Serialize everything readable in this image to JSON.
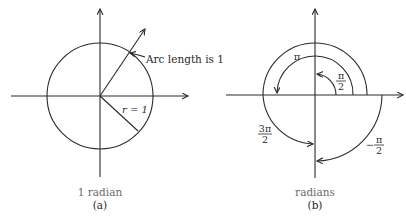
{
  "diagram_a": {
    "arc_label": "Arc length is 1",
    "radius_label": "r = 1",
    "caption": "1 radian",
    "sublabel": "(a)"
  },
  "diagram_b": {
    "label_pi": "π",
    "label_pi_over_2_num": "π",
    "label_pi_over_2_den": "2",
    "label_3pi_over_2_num": "3π",
    "label_3pi_over_2_den": "2",
    "label_neg_pi_over_2_sign": "−",
    "label_neg_pi_over_2_num": "π",
    "label_neg_pi_over_2_den": "2",
    "caption": "radians",
    "sublabel": "(b)"
  },
  "colors": {
    "stroke": "#2a2a2a",
    "caption": "#6a6a6a",
    "background": "#ffffff"
  }
}
